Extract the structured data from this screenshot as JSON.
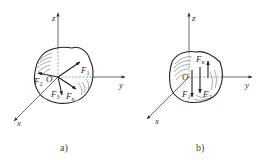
{
  "figure": {
    "panels": [
      {
        "id": "a",
        "caption": "a)",
        "axes": {
          "x": "x",
          "y": "y",
          "z": "z"
        },
        "origin": "O",
        "forces": [
          {
            "label": "F",
            "sub": "1"
          },
          {
            "label": "F",
            "sub": "2"
          },
          {
            "label": "F",
            "sub": "3"
          },
          {
            "label": "F",
            "sub": "n"
          }
        ]
      },
      {
        "id": "b",
        "caption": "b)",
        "axes": {
          "x": "x",
          "y": "y",
          "z": "z"
        },
        "origin": "O",
        "forces": [
          {
            "label": "F",
            "sub": "n"
          },
          {
            "label": "F",
            "sub": "1"
          },
          {
            "label": "F",
            "sub": "2"
          }
        ]
      }
    ],
    "colors": {
      "line": "#333333",
      "hatch": "#555555",
      "background": "#ffffff"
    }
  }
}
